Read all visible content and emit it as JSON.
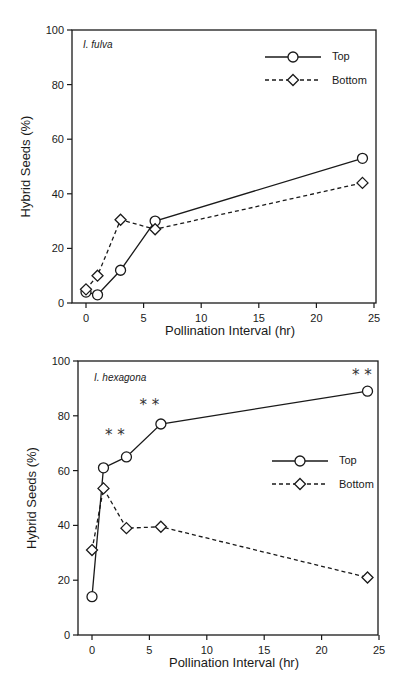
{
  "chart_data": [
    {
      "type": "line",
      "title": "I. fulva",
      "xlabel": "Pollination Interval (hr)",
      "ylabel": "Hybrid Seeds (%)",
      "xlim": [
        0,
        25
      ],
      "ylim": [
        0,
        100
      ],
      "xticks": [
        0,
        5,
        10,
        15,
        20,
        25
      ],
      "yticks": [
        0,
        20,
        40,
        60,
        80,
        100
      ],
      "grid": false,
      "legend_position": "upper right",
      "series": [
        {
          "name": "Top",
          "marker": "circle",
          "line": "solid",
          "x": [
            0,
            1,
            3,
            6,
            24
          ],
          "values": [
            4,
            3,
            12,
            30,
            53
          ]
        },
        {
          "name": "Bottom",
          "marker": "diamond",
          "line": "dashed",
          "x": [
            0,
            1,
            3,
            6,
            24
          ],
          "values": [
            5,
            10,
            30.5,
            27,
            44
          ]
        }
      ],
      "annotations": []
    },
    {
      "type": "line",
      "title": "I. hexagona",
      "xlabel": "Pollination Interval (hr)",
      "ylabel": "Hybrid Seeds (%)",
      "xlim": [
        0,
        25
      ],
      "ylim": [
        0,
        100
      ],
      "xticks": [
        0,
        5,
        10,
        15,
        20,
        25
      ],
      "yticks": [
        0,
        20,
        40,
        60,
        80,
        100
      ],
      "grid": false,
      "legend_position": "center right",
      "series": [
        {
          "name": "Top",
          "marker": "circle",
          "line": "solid",
          "x": [
            0,
            1,
            3,
            6,
            24
          ],
          "values": [
            14,
            61,
            65,
            77,
            89
          ]
        },
        {
          "name": "Bottom",
          "marker": "diamond",
          "line": "dashed",
          "x": [
            0,
            1,
            3,
            6,
            24
          ],
          "values": [
            31,
            53.5,
            39,
            39.5,
            21
          ]
        }
      ],
      "annotations": [
        {
          "text": "* *",
          "x": 2,
          "y": 71
        },
        {
          "text": "* *",
          "x": 5,
          "y": 82
        },
        {
          "text": "* *",
          "x": 23.5,
          "y": 93
        }
      ]
    }
  ],
  "labels": {
    "top_species": "I. fulva",
    "bottom_species": "I. hexagona",
    "xlabel": "Pollination Interval (hr)",
    "ylabel": "Hybrid Seeds (%)",
    "legend_top": "Top",
    "legend_bottom": "Bottom",
    "sig_mark": "* *",
    "xticks": [
      "0",
      "5",
      "10",
      "15",
      "20",
      "25"
    ],
    "yticks": [
      "0",
      "20",
      "40",
      "60",
      "80",
      "100"
    ]
  }
}
